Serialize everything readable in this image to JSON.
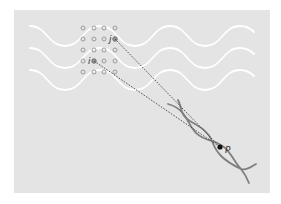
{
  "figure": {
    "colors": {
      "panel": "#e4e4e4",
      "wave": "#ffffff",
      "atom_stroke": "#9a9a9a",
      "atom_highlight": "#7a7a7a",
      "helix": "#7f7f7f",
      "ray": "#444444",
      "point": "#111111"
    },
    "labels": {
      "atom_i": "i",
      "atom_j": "j",
      "point": "P"
    },
    "lattice": {
      "columns": 4,
      "rows": 5
    },
    "incident_waves": 3
  }
}
